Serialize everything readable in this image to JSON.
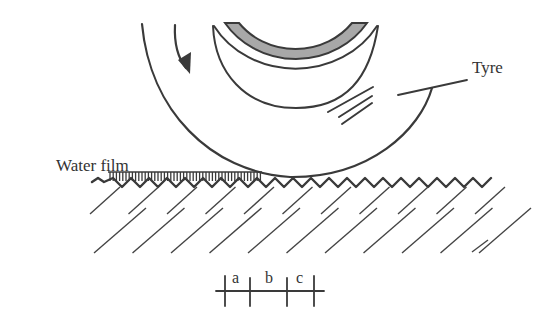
{
  "diagram": {
    "labels": {
      "tyre": "Tyre",
      "water_film": "Water film",
      "zone_a": "a",
      "zone_b": "b",
      "zone_c": "c"
    },
    "colors": {
      "line": "#3a3a3a",
      "rim_fill": "#a8a8a8",
      "background": "#ffffff"
    },
    "rotation_direction": "clockwise"
  }
}
